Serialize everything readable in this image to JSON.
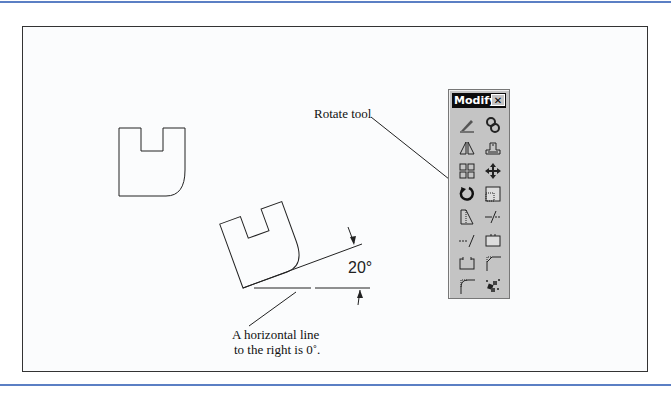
{
  "figure": {
    "callouts": {
      "rotate_tool": "Rotate tool",
      "horizontal_line_1": "A horizontal line",
      "horizontal_line_2": "to the right is 0˚."
    },
    "angle_label": "20°"
  },
  "toolbar": {
    "title": "Modify",
    "close_label": "✕",
    "tools": [
      {
        "name": "erase",
        "icon": "erase-icon"
      },
      {
        "name": "copy",
        "icon": "copy-icon"
      },
      {
        "name": "mirror",
        "icon": "mirror-icon"
      },
      {
        "name": "offset",
        "icon": "offset-icon"
      },
      {
        "name": "array",
        "icon": "array-icon"
      },
      {
        "name": "move",
        "icon": "move-icon"
      },
      {
        "name": "rotate",
        "icon": "rotate-icon"
      },
      {
        "name": "scale",
        "icon": "scale-icon"
      },
      {
        "name": "stretch",
        "icon": "stretch-icon"
      },
      {
        "name": "trim",
        "icon": "trim-icon"
      },
      {
        "name": "extend",
        "icon": "extend-icon"
      },
      {
        "name": "break",
        "icon": "break-icon"
      },
      {
        "name": "chamfer-box",
        "icon": "chamfer-box-icon"
      },
      {
        "name": "chamfer",
        "icon": "chamfer-icon"
      },
      {
        "name": "fillet",
        "icon": "fillet-icon"
      },
      {
        "name": "explode",
        "icon": "explode-icon"
      }
    ]
  },
  "colors": {
    "rule": "#5b7fc4",
    "toolbar_bg": "#c4c4c4",
    "title_bg": "#0c0c0c"
  }
}
